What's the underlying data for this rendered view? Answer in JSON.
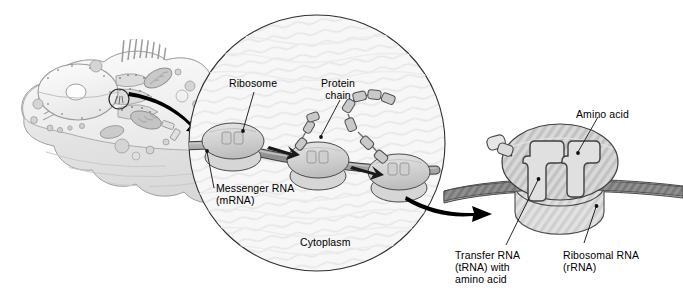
{
  "figure": {
    "background_color": "#ffffff",
    "width": 683,
    "height": 298
  },
  "colors": {
    "outline": "#1a1a1a",
    "cytoplasm_fill": "#f6f6f6",
    "cytoplasm_stroke": "#3a3a3a",
    "ribosome_fill": "#d2d2d2",
    "ribosome_fill_light": "#e3e3e3",
    "ribosome_stroke": "#4a4a4a",
    "mrna_fill": "#9a9a9a",
    "mrna_stroke": "#3d3d3d",
    "amino_acid_fill": "#c9c9c9",
    "amino_acid_stroke": "#4a4a4a",
    "cell_fill": "#ededed",
    "cell_stroke": "#a8a8a8",
    "arrow_fill": "#000000",
    "leader_stroke": "#111111",
    "text": "#000000"
  },
  "panels": {
    "cell_overview": {
      "name": "animal cell illustration",
      "description": "grayscale cutaway animal cell with nucleus, nucleolus, rough endoplasmic reticulum, mitochondria, vesicles and apical microvilli",
      "callout_circle": "small circled region on the rough endoplasmic reticulum"
    },
    "cytoplasm_closeup": {
      "name": "cytoplasm magnification circle",
      "label": "Cytoplasm"
    },
    "ribosome_closeup": {
      "name": "single ribosome magnification"
    }
  },
  "labels": {
    "ribosome": "Ribosome",
    "protein_chain_line1": "Protein",
    "protein_chain_line2": "chain",
    "messenger_rna_line1": "Messenger RNA",
    "messenger_rna_line2": "(mRNA)",
    "cytoplasm": "Cytoplasm",
    "amino_acid": "Amino acid",
    "transfer_rna_line1": "Transfer RNA",
    "transfer_rna_line2": "(tRNA) with",
    "transfer_rna_line3": "amino acid",
    "ribosomal_rna_line1": "Ribosomal RNA",
    "ribosomal_rna_line2": "(rRNA)"
  },
  "arrows": {
    "cell_to_cytoplasm": "thick curved black arrow from cell illustration to cytoplasm circle",
    "cytoplasm_to_ribosome": "thick curved black arrow from cytoplasm circle to ribosome closeup"
  },
  "ribosomes_in_chain": [
    {
      "index": 1,
      "position": "left",
      "translating": true
    },
    {
      "index": 2,
      "position": "middle",
      "translating": true
    },
    {
      "index": 3,
      "position": "right",
      "translating": true
    }
  ],
  "protein_chain_beads": 7,
  "trna_count_in_closeup": 2
}
